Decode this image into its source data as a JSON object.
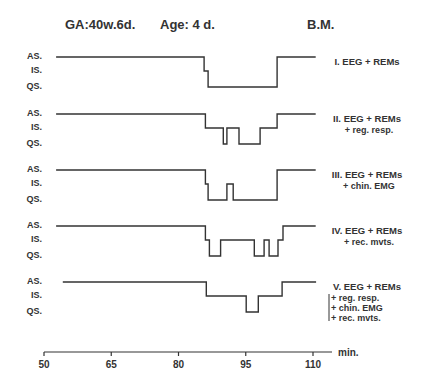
{
  "header": {
    "ga": "GA:40w.6d.",
    "age": "Age: 4 d.",
    "subject": "B.M."
  },
  "chart_data": {
    "type": "line",
    "xlabel": "min.",
    "ylabel": "",
    "xlim": [
      50,
      110
    ],
    "x_ticks": [
      50,
      65,
      80,
      95,
      110
    ],
    "y_levels": [
      "AS.",
      "IS.",
      "QS."
    ],
    "grid": false,
    "legend": "none (panel labels at right of each trace)",
    "series": [
      {
        "name": "I. EEG + REMs",
        "sublabels": [],
        "steps": [
          [
            52.7,
            "AS"
          ],
          [
            85.7,
            "IS"
          ],
          [
            86.6,
            "QS"
          ],
          [
            102.0,
            "AS"
          ],
          [
            110.6,
            "AS"
          ]
        ]
      },
      {
        "name": "II. EEG + REMs",
        "sublabels": [
          "+ reg. resp."
        ],
        "steps": [
          [
            52.7,
            "AS"
          ],
          [
            86.0,
            "IS"
          ],
          [
            90.0,
            "QS"
          ],
          [
            90.8,
            "IS"
          ],
          [
            93.5,
            "QS"
          ],
          [
            98.2,
            "IS"
          ],
          [
            102.0,
            "AS"
          ],
          [
            110.6,
            "AS"
          ]
        ]
      },
      {
        "name": "III. EEG + REMs",
        "sublabels": [
          "+ chin. EMG"
        ],
        "steps": [
          [
            52.7,
            "AS"
          ],
          [
            86.0,
            "IS"
          ],
          [
            86.6,
            "QS"
          ],
          [
            90.8,
            "IS"
          ],
          [
            92.2,
            "QS"
          ],
          [
            102.0,
            "AS"
          ],
          [
            110.6,
            "AS"
          ]
        ]
      },
      {
        "name": "IV. EEG + REMs",
        "sublabels": [
          "+ rec. mvts."
        ],
        "steps": [
          [
            52.7,
            "AS"
          ],
          [
            86.0,
            "IS"
          ],
          [
            86.9,
            "QS"
          ],
          [
            89.4,
            "IS"
          ],
          [
            96.9,
            "QS"
          ],
          [
            99.1,
            "IS"
          ],
          [
            100.2,
            "QS"
          ],
          [
            102.2,
            "IS"
          ],
          [
            103.3,
            "AS"
          ],
          [
            110.6,
            "AS"
          ]
        ]
      },
      {
        "name": "V. EEG + REMs",
        "sublabels": [
          "+ reg. resp.",
          "+ chin. EMG",
          "+ rec. mvts."
        ],
        "steps": [
          [
            54.2,
            "AS"
          ],
          [
            86.2,
            "IS"
          ],
          [
            95.1,
            "QS"
          ],
          [
            97.8,
            "IS"
          ],
          [
            103.1,
            "AS"
          ],
          [
            110.7,
            "AS"
          ]
        ]
      }
    ]
  },
  "panels": [
    {
      "title": "I. EEG + REMs",
      "subs": []
    },
    {
      "title": "II. EEG + REMs",
      "subs": [
        "+ reg. resp."
      ]
    },
    {
      "title": "III. EEG + REMs",
      "subs": [
        "+ chin. EMG"
      ]
    },
    {
      "title": "IV. EEG + REMs",
      "subs": [
        "+ rec. mvts."
      ]
    },
    {
      "title": "V. EEG + REMs",
      "subs": [
        "+ reg. resp.",
        "+ chin. EMG",
        "+ rec. mvts."
      ]
    }
  ],
  "axis": {
    "unit": "min.",
    "ticks": [
      "50",
      "65",
      "80",
      "95",
      "110"
    ]
  },
  "levels": {
    "as": "AS.",
    "is": "IS.",
    "qs": "QS."
  }
}
